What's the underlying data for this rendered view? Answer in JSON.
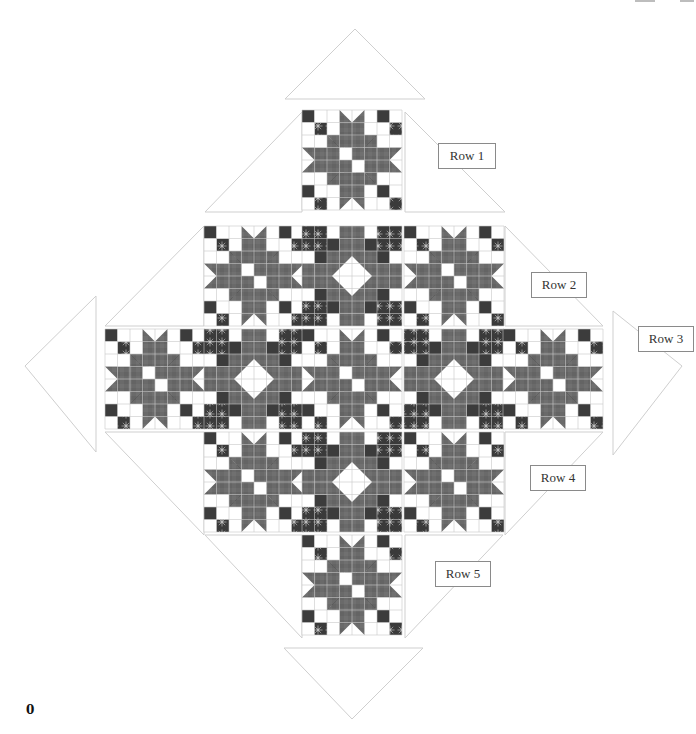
{
  "diagram": {
    "labels": [
      {
        "id": "row1",
        "text": "Row 1",
        "x": 438,
        "y": 143,
        "w": 56
      },
      {
        "id": "row2",
        "text": "Row 2",
        "x": 531,
        "y": 272,
        "w": 54
      },
      {
        "id": "row3",
        "text": "Row 3",
        "x": 638,
        "y": 326,
        "w": 54
      },
      {
        "id": "row4",
        "text": "Row 4",
        "x": 530,
        "y": 465,
        "w": 54
      },
      {
        "id": "row5",
        "text": "Row 5",
        "x": 435,
        "y": 561,
        "w": 54
      }
    ],
    "page_number": "0",
    "colors": {
      "dark": "#3c3c3c",
      "medium": "#6e6e6e",
      "mid_print": "#5a5a5a",
      "light": "#ffffff",
      "grid": "#c8c8c8",
      "triangle_stroke": "#cfcfcf",
      "flower": "#a8a8a8"
    },
    "grid": {
      "unit": 12.9,
      "block_units": 8,
      "origin_x": 105,
      "origin_y": 110,
      "block_size": 99.5
    },
    "rows": [
      {
        "name": "Row 1",
        "blocks": [
          {
            "col": 2,
            "type": "star"
          }
        ],
        "y": 110,
        "h": 101
      },
      {
        "name": "Row 2",
        "blocks": [
          {
            "col": 1,
            "type": "star"
          },
          {
            "col": 2,
            "type": "diamond"
          },
          {
            "col": 3,
            "type": "star"
          }
        ],
        "y": 226,
        "h": 103
      },
      {
        "name": "Row 3",
        "blocks": [
          {
            "col": 0,
            "type": "star"
          },
          {
            "col": 1,
            "type": "diamond"
          },
          {
            "col": 2,
            "type": "star"
          },
          {
            "col": 3,
            "type": "diamond"
          },
          {
            "col": 4,
            "type": "star"
          }
        ],
        "y": 329,
        "h": 103
      },
      {
        "name": "Row 4",
        "blocks": [
          {
            "col": 1,
            "type": "star"
          },
          {
            "col": 2,
            "type": "diamond"
          },
          {
            "col": 3,
            "type": "star"
          }
        ],
        "y": 432,
        "h": 103
      },
      {
        "name": "Row 5",
        "blocks": [
          {
            "col": 2,
            "type": "star"
          }
        ],
        "y": 535,
        "h": 103
      }
    ],
    "columns_x": [
      105,
      204,
      302,
      404,
      503
    ],
    "column_width": 100,
    "setting_triangles": [
      {
        "id": "top",
        "points": "285,99 355,29 425,99"
      },
      {
        "id": "row1-sides",
        "points": "205,212 302,112 302,212 M405,112 505,212 405,212"
      },
      {
        "id": "left-big",
        "points": "25,366 96,296 96,452"
      },
      {
        "id": "left-inner",
        "points": "105,326 204,226 204,326"
      },
      {
        "id": "left-inner-low",
        "points": "105,432 204,535 204,432"
      },
      {
        "id": "right-inner",
        "points": "505,226 603,326 505,326"
      },
      {
        "id": "right-big",
        "points": "613,311 682,366 613,455"
      },
      {
        "id": "right-inner-low",
        "points": "505,535 603,432 505,432"
      },
      {
        "id": "bottom-left",
        "points": "205,535 302,638 302,535"
      },
      {
        "id": "bottom-right",
        "points": "405,535 405,638 503,535"
      },
      {
        "id": "bottom",
        "points": "284,648 423,648 352,719"
      }
    ]
  }
}
